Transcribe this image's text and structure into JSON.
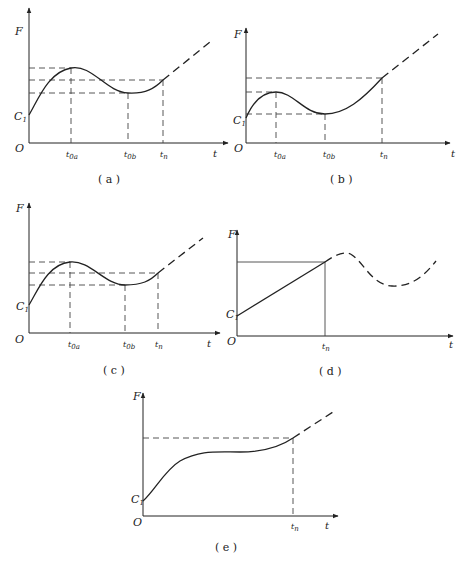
{
  "panels": [
    {
      "id": "a",
      "caption": "( a )",
      "y_axis_label": "F",
      "x_axis_label": "t",
      "origin_label": "O",
      "intercept_label": "C1",
      "ticks": [
        "t0a",
        "t0b",
        "tn"
      ],
      "description": "Curve rises from C1 to local max at t0a, dips to local min at t0b, rises to tn, then continues as dashed line"
    },
    {
      "id": "b",
      "caption": "( b )",
      "y_axis_label": "F",
      "x_axis_label": "t",
      "origin_label": "O",
      "intercept_label": "C1",
      "ticks": [
        "t0a",
        "t0b",
        "tn"
      ],
      "description": "Curve rises from C1 to small local max at t0a, dips to local min at t0b near C1 level, rises steeply to tn, then dashed"
    },
    {
      "id": "c",
      "caption": "( c )",
      "y_axis_label": "F",
      "x_axis_label": "t",
      "origin_label": "O",
      "intercept_label": "C1",
      "ticks": [
        "t0a",
        "t0b",
        "tn"
      ],
      "description": "Same shape as (a): max at t0a, min at t0b, value at tn between them, dashed continuation"
    },
    {
      "id": "d",
      "caption": "( d )",
      "y_axis_label": "F",
      "x_axis_label": "t",
      "origin_label": "O",
      "intercept_label": "C1",
      "ticks": [
        "tn"
      ],
      "description": "Straight line from C1 up to tn, then dashed wave with max then min"
    },
    {
      "id": "e",
      "caption": "( e )",
      "y_axis_label": "F",
      "x_axis_label": "t",
      "origin_label": "O",
      "intercept_label": "C1",
      "ticks": [
        "tn"
      ],
      "description": "Curve rises from C1, plateaus, rises to tn, then dashed continuation"
    }
  ]
}
